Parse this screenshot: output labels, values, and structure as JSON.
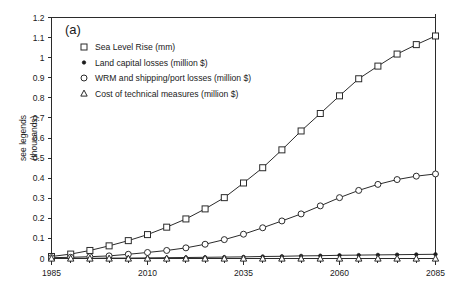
{
  "panel_label": "(a)",
  "axis": {
    "ylabel_line1": "see legends",
    "ylabel_line2": "(thousands)",
    "xlabel": ""
  },
  "chart_data": {
    "type": "line",
    "title": "",
    "panel": "(a)",
    "xlabel": "",
    "ylabel": "see legends (thousands)",
    "xlim": [
      1985,
      2085
    ],
    "ylim": [
      0,
      1.2
    ],
    "xticks": [
      1985,
      2010,
      2035,
      2060,
      2085
    ],
    "xtick_labels": [
      "1985",
      "2010",
      "2035",
      "2060",
      "2085"
    ],
    "xticks_minor_step": 5,
    "yticks": [
      0,
      0.1,
      0.2,
      0.3,
      0.4,
      0.5,
      0.6,
      0.7,
      0.8,
      0.9,
      1,
      1.1,
      1.2
    ],
    "ytick_labels": [
      "0",
      "0.1",
      "0.2",
      "0.3",
      "0.4",
      "0.5",
      "0.6",
      "0.7",
      "0.8",
      "0.9",
      "1",
      "1.1",
      "1.2"
    ],
    "grid": false,
    "legend_position": "upper-left-inside",
    "x": [
      1985,
      1990,
      1995,
      2000,
      2005,
      2010,
      2015,
      2020,
      2025,
      2030,
      2035,
      2040,
      2045,
      2050,
      2055,
      2060,
      2065,
      2070,
      2075,
      2080,
      2085
    ],
    "series": [
      {
        "name": "Sea Level Rise (mm)",
        "marker": "open-square",
        "values": [
          0.01,
          0.022,
          0.04,
          0.063,
          0.089,
          0.119,
          0.156,
          0.197,
          0.247,
          0.303,
          0.376,
          0.452,
          0.541,
          0.635,
          0.722,
          0.81,
          0.895,
          0.958,
          1.018,
          1.065,
          1.108
        ]
      },
      {
        "name": "Land capital losses (million $)",
        "marker": "filled-dot",
        "values": [
          0.0,
          0.001,
          0.001,
          0.002,
          0.002,
          0.003,
          0.004,
          0.005,
          0.006,
          0.007,
          0.008,
          0.01,
          0.011,
          0.013,
          0.014,
          0.016,
          0.017,
          0.018,
          0.019,
          0.02,
          0.021
        ]
      },
      {
        "name": "WRM and shipping/port losses (million $)",
        "marker": "open-circle",
        "values": [
          0.004,
          0.006,
          0.009,
          0.013,
          0.021,
          0.03,
          0.04,
          0.053,
          0.071,
          0.094,
          0.121,
          0.153,
          0.187,
          0.222,
          0.262,
          0.303,
          0.339,
          0.369,
          0.393,
          0.41,
          0.421
        ]
      },
      {
        "name": "Cost of technical measures (million $)",
        "marker": "open-triangle",
        "values": [
          0.0,
          0.0,
          0.0,
          0.0,
          0.0,
          0.0,
          0.0,
          0.0,
          0.0,
          0.0,
          0.0,
          0.0,
          0.0,
          0.0,
          0.0,
          0.0,
          0.0,
          0.0,
          0.0,
          0.0,
          0.0
        ]
      }
    ]
  },
  "legend": {
    "items": [
      {
        "marker": "open-square",
        "label": "Sea Level Rise (mm)"
      },
      {
        "marker": "filled-dot",
        "label": "Land capital losses (million $)"
      },
      {
        "marker": "open-circle",
        "label": "WRM and shipping/port losses (million $)"
      },
      {
        "marker": "open-triangle",
        "label": "Cost of technical measures (million $)"
      }
    ]
  }
}
